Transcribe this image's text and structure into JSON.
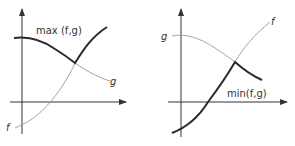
{
  "left_panel": {
    "title_label": "max (f,g)",
    "curve_f_label": "f",
    "curve_g_label": "g"
  },
  "right_panel": {
    "title_label": "min(f,g)",
    "curve_f_label": "f",
    "curve_g_label": "g"
  },
  "colors": {
    "thin_curve": "#9a9a9a",
    "thick_curve": "#2a2a2a",
    "axis": "#333333"
  }
}
